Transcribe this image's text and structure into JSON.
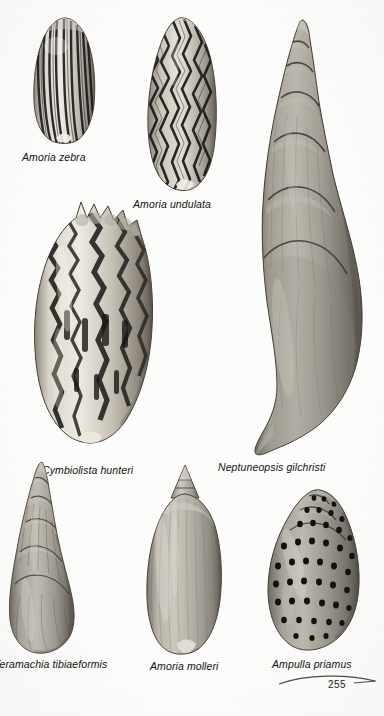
{
  "page": {
    "kind": "book-plate-scan",
    "page_number": "255",
    "background_color": "#fdfdfc",
    "ink_color": "#111111",
    "palette": {
      "shell_light": "#e6e2da",
      "shell_mid": "#9d978c",
      "shell_dark": "#555049",
      "marking_dark": "#1c1a18",
      "shadow": "#7d776e"
    }
  },
  "specimens": [
    {
      "id": "amoria-zebra",
      "label": "Amoria zebra",
      "pattern": "vertical-dark-stripes",
      "shape": "ovate-volute",
      "label_x": 22,
      "label_y": 151,
      "shell_x": 26,
      "shell_y": 16,
      "shell_w": 78,
      "shell_h": 128
    },
    {
      "id": "amoria-undulata",
      "label": "Amoria undulata",
      "pattern": "wavy-zigzag-lines",
      "shape": "elongate-ovate-volute",
      "label_x": 133,
      "label_y": 198,
      "shell_x": 138,
      "shell_y": 16,
      "shell_w": 90,
      "shell_h": 176
    },
    {
      "id": "neptuneopsis-gilchristi",
      "label": "Neptuneopsis gilchristi",
      "pattern": "plain-smooth-growth-lines",
      "shape": "tall-spired-fusiform",
      "whorls": 7,
      "label_x": 218,
      "label_y": 461,
      "shell_x": 243,
      "shell_y": 18,
      "shell_w": 130,
      "shell_h": 440
    },
    {
      "id": "cymbiolista-hunteri",
      "label": "Cymbiolista hunteri",
      "pattern": "irregular-dark-zigzag-blotches",
      "shape": "knobbed-shoulder-volute",
      "label_x": 42,
      "label_y": 464,
      "shell_x": 24,
      "shell_y": 198,
      "shell_w": 142,
      "shell_h": 252
    },
    {
      "id": "teramachia-tibiaeformis",
      "label": "Teramachia tibiaeformis",
      "label_clipped_left": true,
      "pattern": "plain-axial-ribs",
      "shape": "slender-high-spired-fusiform",
      "label_x": -6,
      "label_y": 658,
      "shell_x": 4,
      "shell_y": 460,
      "shell_w": 84,
      "shell_h": 196
    },
    {
      "id": "amoria-molleri",
      "label": "Amoria molleri",
      "pattern": "plain-faint-axial-lines",
      "shape": "ovate-volute-pointed-spire",
      "label_x": 150,
      "label_y": 660,
      "shell_x": 141,
      "shell_y": 464,
      "shell_w": 86,
      "shell_h": 192
    },
    {
      "id": "ampulla-priamus",
      "label": "Ampulla priamus",
      "pattern": "spiral-rows-of-dark-spots",
      "shape": "globose-ovate",
      "label_x": 272,
      "label_y": 658,
      "shell_x": 262,
      "shell_y": 484,
      "shell_w": 104,
      "shell_h": 170
    }
  ]
}
